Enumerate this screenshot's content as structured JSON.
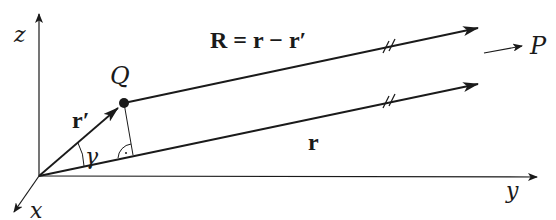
{
  "diagram": {
    "type": "vector-geometry",
    "axes": {
      "x_label": "x",
      "y_label": "y",
      "z_label": "z"
    },
    "points": {
      "source_label": "Q",
      "field_label": "P"
    },
    "vectors": {
      "r_prime_label": "r′",
      "r_label": "r",
      "R_label": "R = r − r′"
    },
    "angle_label": "γ",
    "parallel_marks": "//",
    "colors": {
      "stroke": "#1a1a1a",
      "background": "#ffffff"
    }
  }
}
